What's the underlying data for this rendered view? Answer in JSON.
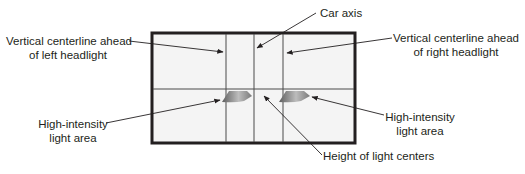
{
  "diagram": {
    "type": "headlight-aiming-screen",
    "labels": {
      "car_axis": "Car axis",
      "left_centerline": [
        "Vertical centerline ahead",
        "of left headlight"
      ],
      "right_centerline": [
        "Vertical centerline ahead",
        "of right headlight"
      ],
      "left_high_intensity": [
        "High-intensity",
        "light area"
      ],
      "right_high_intensity": [
        "High-intensity",
        "light area"
      ],
      "light_center_height": "Height of light centers"
    },
    "colors": {
      "frame": "#231f20",
      "line": "#3a3a3a",
      "screen_fill": "#f4f4f4",
      "beam_dark": "#6e6e6e",
      "beam_light": "#cfcfcf",
      "text": "#231f20"
    }
  }
}
